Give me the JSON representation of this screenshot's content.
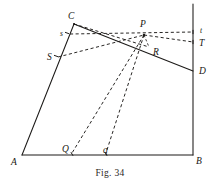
{
  "figure": {
    "caption": "Fig. 34",
    "caption_y": 168,
    "width": 220,
    "height": 192,
    "ink_color": "#1c1a18",
    "background_color": "#ffffff"
  },
  "points": {
    "A": {
      "x": 22,
      "y": 155
    },
    "B": {
      "x": 193,
      "y": 155
    },
    "C": {
      "x": 74,
      "y": 24
    },
    "D": {
      "x": 193,
      "y": 71
    },
    "P": {
      "x": 144,
      "y": 35
    },
    "R": {
      "x": 149,
      "y": 47
    },
    "S": {
      "x": 58,
      "y": 57
    },
    "s": {
      "x": 70,
      "y": 34
    },
    "T": {
      "x": 193,
      "y": 42
    },
    "t": {
      "x": 193,
      "y": 32
    },
    "Q": {
      "x": 72,
      "y": 153
    },
    "q": {
      "x": 106,
      "y": 153
    },
    "V_top": {
      "x": 193,
      "y": 4
    }
  },
  "labels": [
    {
      "name": "label-C",
      "text": "C",
      "x": 68,
      "y": 19,
      "size": "normal"
    },
    {
      "name": "label-s-lower",
      "text": "s",
      "x": 60,
      "y": 36,
      "size": "small"
    },
    {
      "name": "label-S-upper",
      "text": "S",
      "x": 47,
      "y": 60,
      "size": "normal"
    },
    {
      "name": "label-P",
      "text": "P",
      "x": 140,
      "y": 27,
      "size": "normal"
    },
    {
      "name": "label-R",
      "text": "R",
      "x": 153,
      "y": 55,
      "size": "normal"
    },
    {
      "name": "label-t-lower",
      "text": "t",
      "x": 200,
      "y": 33,
      "size": "small"
    },
    {
      "name": "label-T-upper",
      "text": "T",
      "x": 199,
      "y": 46,
      "size": "normal"
    },
    {
      "name": "label-D",
      "text": "D",
      "x": 199,
      "y": 74,
      "size": "normal"
    },
    {
      "name": "label-A",
      "text": "A",
      "x": 11,
      "y": 165,
      "size": "normal"
    },
    {
      "name": "label-B",
      "text": "B",
      "x": 196,
      "y": 164,
      "size": "normal"
    },
    {
      "name": "label-Q-upper",
      "text": "Q",
      "x": 62,
      "y": 152,
      "size": "normal"
    },
    {
      "name": "label-q-lower",
      "text": "q",
      "x": 103,
      "y": 153,
      "size": "normal"
    }
  ],
  "solid_segments": [
    {
      "name": "segment-AB",
      "from": "A",
      "to": "B"
    },
    {
      "name": "segment-AC",
      "from": "A",
      "to": "C"
    },
    {
      "name": "segment-CD",
      "from": "C",
      "to": "D"
    },
    {
      "name": "segment-BD-vertical",
      "from": "B",
      "to": "V_top"
    }
  ],
  "dashed_segments": [
    {
      "name": "dashed-s-to-t",
      "from": "s",
      "to": "t"
    },
    {
      "name": "dashed-S-to-P",
      "from": "S",
      "to": "P"
    },
    {
      "name": "dashed-P-to-T",
      "from": "P",
      "to": "T"
    },
    {
      "name": "dashed-C-to-R",
      "from": "C",
      "to": "R"
    },
    {
      "name": "dashed-P-to-Q",
      "from": "P",
      "to": "Q"
    },
    {
      "name": "dashed-P-to-q",
      "from": "P",
      "to": "q"
    },
    {
      "name": "dashed-P-to-R",
      "from": "P",
      "to": "R"
    }
  ],
  "tick_marks": [
    {
      "name": "tick-on-AC-at-s",
      "x": 67,
      "y": 33,
      "angle": 20
    },
    {
      "name": "tick-on-AC-at-S",
      "x": 56,
      "y": 56,
      "angle": 20
    },
    {
      "name": "tick-on-vertical-at-t",
      "x": 193,
      "y": 32,
      "angle": 90
    },
    {
      "name": "tick-on-vertical-at-T",
      "x": 193,
      "y": 42,
      "angle": 90
    },
    {
      "name": "tick-on-AB-at-Q",
      "x": 72,
      "y": 154,
      "angle": 60
    },
    {
      "name": "tick-on-AB-at-q",
      "x": 106,
      "y": 154,
      "angle": 60
    }
  ]
}
